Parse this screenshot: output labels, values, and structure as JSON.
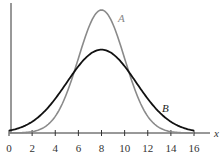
{
  "chart_data": {
    "type": "line",
    "title": "",
    "xlabel": "x",
    "ylabel": "",
    "xlim": [
      0,
      16
    ],
    "ylim": [
      0,
      1
    ],
    "grid": false,
    "legend": "inline labels",
    "x_ticks": [
      "0",
      "2",
      "4",
      "6",
      "8",
      "10",
      "12",
      "14",
      "16"
    ],
    "series": [
      {
        "name": "A",
        "color": "#8a8a8a",
        "mean": 8,
        "sd": 2,
        "peak": 0.93,
        "x": [
          0,
          2,
          4,
          5,
          6,
          7,
          8,
          9,
          10,
          11,
          12,
          14,
          16
        ],
        "y": [
          0.0,
          0.02,
          0.12,
          0.3,
          0.56,
          0.83,
          0.93,
          0.83,
          0.56,
          0.3,
          0.12,
          0.02,
          0.0
        ]
      },
      {
        "name": "B",
        "color": "#111111",
        "mean": 8,
        "sd": 3,
        "peak": 0.63,
        "x": [
          0,
          2,
          4,
          6,
          8,
          10,
          12,
          14,
          16
        ],
        "y": [
          0.04,
          0.12,
          0.29,
          0.52,
          0.63,
          0.52,
          0.29,
          0.12,
          0.04
        ]
      }
    ]
  },
  "labels": {
    "x_axis": "x",
    "curve_a": "A",
    "curve_b": "B",
    "ticks": [
      "0",
      "2",
      "4",
      "6",
      "8",
      "10",
      "12",
      "14",
      "16"
    ]
  }
}
